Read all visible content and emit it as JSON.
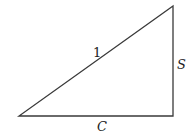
{
  "diagram": {
    "type": "right-triangle",
    "stroke_color": "#3a3a3a",
    "vertices": {
      "bottom_left": [
        19,
        116
      ],
      "bottom_right": [
        173,
        116
      ],
      "top_right": [
        173,
        6
      ]
    },
    "labels": {
      "hypotenuse": "1",
      "vertical_side": "S",
      "horizontal_side": "C"
    }
  }
}
